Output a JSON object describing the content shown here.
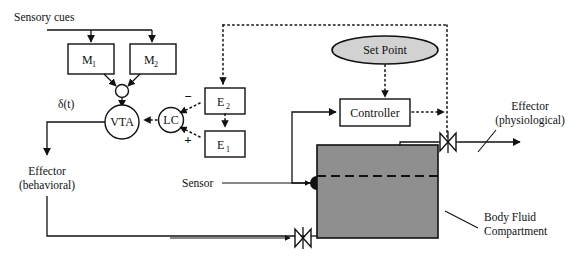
{
  "figure": {
    "title": "Sensory cues",
    "type": "block-diagram"
  },
  "labels": {
    "sensory_cues": "Sensory cues",
    "delta_t": "δ(t)",
    "effector_behavioral_line1": "Effector",
    "effector_behavioral_line2": "(behavioral)",
    "effector_physiological_line1": "Effector",
    "effector_physiological_line2": "(physiological)",
    "sensor": "Sensor",
    "body_fluid_line1": "Body Fluid",
    "body_fluid_line2": "Compartment",
    "sign_minus": "−",
    "sign_plus": "+"
  },
  "nodes": {
    "m1": {
      "base": "M",
      "sub": "1"
    },
    "m2": {
      "base": "M",
      "sub": "2"
    },
    "e1": {
      "base": "E",
      "sub": "1"
    },
    "e2": {
      "base": "E",
      "sub": "2"
    },
    "summing_junction": "",
    "vta": "VTA",
    "lc": "LC",
    "set_point": "Set Point",
    "controller": "Controller"
  },
  "colors": {
    "compartment_fill": "#8f8f8f",
    "setpoint_fill": "#d2d2d2",
    "stroke": "#111111",
    "background": "#ffffff"
  }
}
